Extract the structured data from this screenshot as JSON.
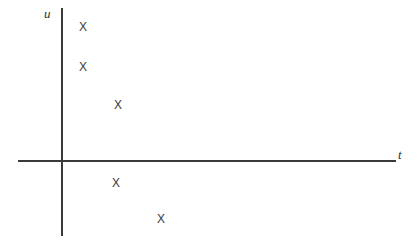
{
  "figure": {
    "background_color": "#ffffff",
    "line_color": "#3a3a3a",
    "marker_color": "#3a3a3a",
    "marker_glyph": "X"
  },
  "axes": {
    "vertical": {
      "label": "u",
      "label_x": 44,
      "label_y": 7,
      "x": 62,
      "y_top": 8,
      "y_bottom": 236
    },
    "horizontal": {
      "label": "t",
      "label_x": 398,
      "label_y": 148,
      "y": 161,
      "x_left": 18,
      "x_right": 396
    },
    "origin": {
      "x": 62,
      "y": 161
    }
  },
  "chart_data": {
    "type": "scatter",
    "title": "",
    "xlabel": "t",
    "ylabel": "u",
    "grid": false,
    "legend": null,
    "marker": "X",
    "xlim": [
      -44,
      334
    ],
    "ylim": [
      -75,
      153
    ],
    "points": [
      {
        "label": "X",
        "px": 83,
        "py": 27,
        "t": 21,
        "u": 134
      },
      {
        "label": "X",
        "px": 83,
        "py": 67,
        "t": 21,
        "u": 94
      },
      {
        "label": "X",
        "px": 118,
        "py": 105,
        "t": 56,
        "u": 56
      },
      {
        "label": "X",
        "px": 116,
        "py": 183,
        "t": 54,
        "u": -22
      },
      {
        "label": "X",
        "px": 161,
        "py": 219,
        "t": 99,
        "u": -58
      }
    ],
    "x": [
      21,
      21,
      56,
      54,
      99
    ],
    "values": [
      134,
      94,
      56,
      -22,
      -58
    ]
  }
}
